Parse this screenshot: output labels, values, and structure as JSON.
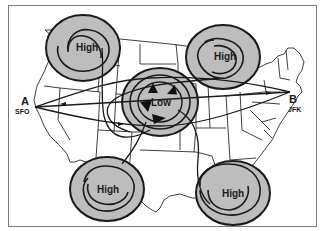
{
  "diagram": {
    "title": "",
    "colors": {
      "background": "#ffffff",
      "frame": "#7a7a7a",
      "map_lines": "#2a2a2a",
      "pressure_fill": "#bdbdbd",
      "ring_stroke": "#1a1a1a",
      "route_stroke": "#1a1a1a"
    },
    "endpoints": {
      "origin": {
        "letter": "A",
        "code": "SFO"
      },
      "destination": {
        "letter": "B",
        "code": "JFK"
      }
    },
    "pressure_systems": [
      {
        "id": "high-northwest",
        "label": "High",
        "type": "high",
        "cx": 83,
        "cy": 48
      },
      {
        "id": "high-northeast",
        "label": "High",
        "type": "high",
        "cx": 223,
        "cy": 57
      },
      {
        "id": "low-central",
        "label": "Low",
        "type": "low",
        "cx": 160,
        "cy": 102
      },
      {
        "id": "high-southwest",
        "label": "High",
        "type": "high",
        "cx": 107,
        "cy": 189
      },
      {
        "id": "high-southeast",
        "label": "High",
        "type": "high",
        "cx": 233,
        "cy": 193
      }
    ],
    "routes": [
      {
        "id": "route-straight",
        "description": "Direct eastbound route A to B"
      },
      {
        "id": "route-northern",
        "description": "Route curving north around the Low"
      },
      {
        "id": "route-southern",
        "description": "Route curving south around the Low"
      }
    ]
  }
}
